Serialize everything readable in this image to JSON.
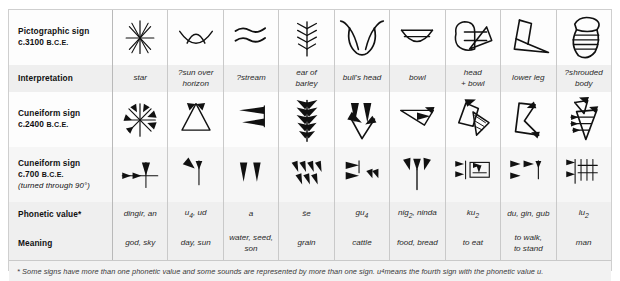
{
  "table": {
    "row_labels": [
      {
        "line1": "Pictographic sign",
        "line2_pre": "c.3100 ",
        "line2_sub": "B.C.E.",
        "line3": ""
      },
      {
        "line1": "Interpretation",
        "line2_pre": "",
        "line2_sub": "",
        "line3": ""
      },
      {
        "line1": "Cuneiform sign",
        "line2_pre": "c.2400 ",
        "line2_sub": "B.C.E.",
        "line3": ""
      },
      {
        "line1": "Cuneiform sign",
        "line2_pre": "c.700 ",
        "line2_sub": "B.C.E.",
        "line3": "(turned through 90°)"
      },
      {
        "line1": "Phonetic value*",
        "line2_pre": "",
        "line2_sub": "",
        "line3": ""
      },
      {
        "line1": "Meaning",
        "line2_pre": "",
        "line2_sub": "",
        "line3": ""
      }
    ],
    "columns": [
      {
        "id": "star",
        "interpretation": "star",
        "phonetic": "dingir, an",
        "meaning": "god, sky",
        "pictograph": "star-pictograph",
        "cuneiform_2400": "star-cuneiform-2400",
        "cuneiform_700": "star-cuneiform-700"
      },
      {
        "id": "sun",
        "interpretation": "?sun over horizon",
        "phonetic": "u4, ud",
        "meaning": "day, sun",
        "pictograph": "sun-pictograph",
        "cuneiform_2400": "sun-cuneiform-2400",
        "cuneiform_700": "sun-cuneiform-700"
      },
      {
        "id": "stream",
        "interpretation": "?stream",
        "phonetic": "a",
        "meaning": "water, seed, son",
        "pictograph": "stream-pictograph",
        "cuneiform_2400": "stream-cuneiform-2400",
        "cuneiform_700": "stream-cuneiform-700"
      },
      {
        "id": "barley",
        "interpretation": "ear of barley",
        "phonetic": "še",
        "meaning": "grain",
        "pictograph": "barley-pictograph",
        "cuneiform_2400": "barley-cuneiform-2400",
        "cuneiform_700": "barley-cuneiform-700"
      },
      {
        "id": "bull",
        "interpretation": "bull's head",
        "phonetic": "gu4",
        "meaning": "cattle",
        "pictograph": "bull-pictograph",
        "cuneiform_2400": "bull-cuneiform-2400",
        "cuneiform_700": "bull-cuneiform-700"
      },
      {
        "id": "bowl",
        "interpretation": "bowl",
        "phonetic": "nig2, ninda",
        "meaning": "food, bread",
        "pictograph": "bowl-pictograph",
        "cuneiform_2400": "bowl-cuneiform-2400",
        "cuneiform_700": "bowl-cuneiform-700"
      },
      {
        "id": "head-bowl",
        "interpretation": "head + bowl",
        "phonetic": "ku2",
        "meaning": "to eat",
        "pictograph": "head-bowl-pictograph",
        "cuneiform_2400": "head-bowl-cuneiform-2400",
        "cuneiform_700": "head-bowl-cuneiform-700"
      },
      {
        "id": "leg",
        "interpretation": "lower leg",
        "phonetic": "du, gin, gub",
        "meaning": "to walk, to stand",
        "pictograph": "leg-pictograph",
        "cuneiform_2400": "leg-cuneiform-2400",
        "cuneiform_700": "leg-cuneiform-700"
      },
      {
        "id": "body",
        "interpretation": "?shrouded body",
        "phonetic": "lu2",
        "meaning": "man",
        "pictograph": "body-pictograph",
        "cuneiform_2400": "body-cuneiform-2400",
        "cuneiform_700": "body-cuneiform-700"
      }
    ],
    "interpretation_display": [
      "star",
      "?sun over<br>horizon",
      "?stream",
      "ear of<br>barley",
      "bull's head",
      "bowl",
      "head<br>+ bowl",
      "lower leg",
      "?shrouded<br>body"
    ],
    "phonetic_display": [
      "dingir, an",
      "u<sub>4</sub>, ud",
      "a",
      "še",
      "gu<sub>4</sub>",
      "nig<sub>2</sub>, ninda",
      "ku<sub>2</sub>",
      "du, gin, gub",
      "lu<sub>2</sub>"
    ],
    "meaning_display": [
      "god, sky",
      "day, sun",
      "water, seed,<br>son",
      "grain",
      "cattle",
      "food, bread",
      "to eat",
      "to walk,<br>to stand",
      "man"
    ]
  },
  "footnote": {
    "text_pre": "* Some signs have more than one phonetic value and some sounds are represented by more than one sign. u",
    "text_sub": "4",
    "text_post": " means the fourth sign with the phonetic value u."
  },
  "colors": {
    "page_background": "#ffffff",
    "table_background": "#fbfbfb",
    "band_light": "#fdfdfd",
    "band_dark": "#efefef",
    "band_mid": "#f6f6f6",
    "border": "#c9c9c9",
    "ink": "#111111",
    "footnote_background": "#f2f2f2"
  }
}
